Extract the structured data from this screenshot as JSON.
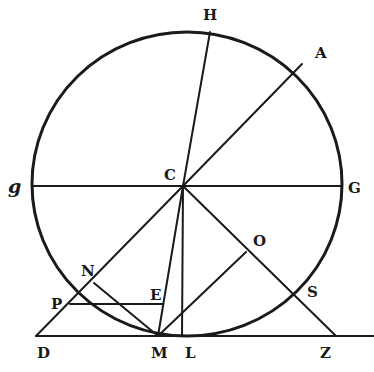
{
  "diagram": {
    "type": "geometric-figure",
    "stroke_color": "#1a1a1a",
    "background": "#ffffff",
    "circle": {
      "cx": 187,
      "cy": 184,
      "rx": 155,
      "ry": 152
    },
    "labels": {
      "H": "H",
      "A": "A",
      "C": "C",
      "g": "g",
      "G": "G",
      "N": "N",
      "O": "O",
      "P": "P",
      "E": "E",
      "S": "S",
      "D": "D",
      "M": "M",
      "L": "L",
      "Z": "Z"
    },
    "points": {
      "C": [
        183,
        186
      ],
      "H": [
        210,
        32
      ],
      "A": [
        302,
        64
      ],
      "g": [
        32,
        186
      ],
      "G": [
        342,
        186
      ],
      "D": [
        36,
        336
      ],
      "M": [
        158,
        336
      ],
      "L": [
        182,
        336
      ],
      "Z": [
        336,
        336
      ],
      "P": [
        70,
        304
      ],
      "N": [
        94,
        283
      ],
      "E": [
        163,
        304
      ],
      "O": [
        246,
        252
      ],
      "S": [
        287,
        291
      ]
    },
    "segments": [
      [
        "H",
        "C"
      ],
      [
        "A",
        "C"
      ],
      [
        "g",
        "G"
      ],
      [
        "C",
        "D"
      ],
      [
        "C",
        "Z"
      ],
      [
        "C",
        "M"
      ],
      [
        "C",
        "L"
      ],
      [
        "P",
        "E"
      ],
      [
        "N",
        "M"
      ],
      [
        "M",
        "O"
      ],
      [
        "D",
        "baseline-end"
      ]
    ]
  }
}
